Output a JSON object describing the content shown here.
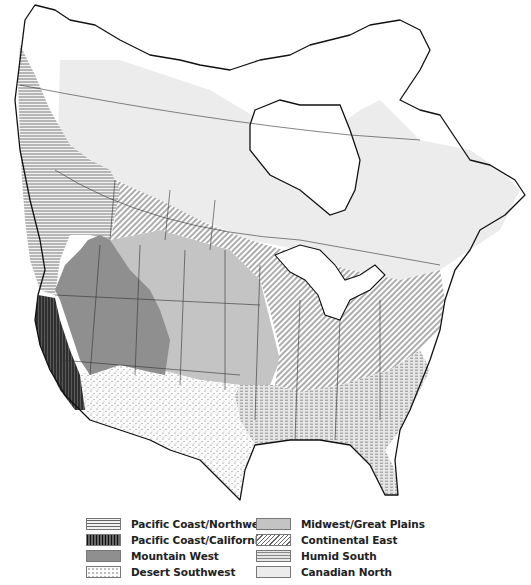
{
  "map": {
    "title": "",
    "extent": "North America (Canada, United States, northern Mexico)",
    "regions": [
      {
        "id": "pacific-northwest",
        "name": "Pacific Coast/Northwest",
        "pattern": "horizontal-lines",
        "color": "#8a8a8a"
      },
      {
        "id": "pacific-california",
        "name": "Pacific Coast/California",
        "pattern": "vertical-lines",
        "color": "#3a3a3a"
      },
      {
        "id": "mountain-west",
        "name": "Mountain West",
        "pattern": "solid",
        "color": "#8f8f8f"
      },
      {
        "id": "desert-southwest",
        "name": "Desert Southwest",
        "pattern": "dots",
        "color": "#f4f4f4"
      },
      {
        "id": "midwest-great-plains",
        "name": "Midwest/Great Plains",
        "pattern": "solid",
        "color": "#c4c4c4"
      },
      {
        "id": "continental-east",
        "name": "Continental East",
        "pattern": "diagonal-lines",
        "color": "#8c8c8c"
      },
      {
        "id": "humid-south",
        "name": "Humid South",
        "pattern": "dashed-lines",
        "color": "#d6d6d6"
      },
      {
        "id": "canadian-north",
        "name": "Canadian North",
        "pattern": "solid",
        "color": "#ececec"
      }
    ]
  },
  "legend": {
    "left": [
      {
        "label": "Pacific Coast/Northwest",
        "swatch": "pacific-northwest"
      },
      {
        "label": "Pacific Coast/California",
        "swatch": "pacific-california"
      },
      {
        "label": "Mountain West",
        "swatch": "mountain-west"
      },
      {
        "label": "Desert Southwest",
        "swatch": "desert-southwest"
      }
    ],
    "right": [
      {
        "label": "Midwest/Great Plains",
        "swatch": "midwest-great-plains"
      },
      {
        "label": "Continental East",
        "swatch": "continental-east"
      },
      {
        "label": "Humid South",
        "swatch": "humid-south"
      },
      {
        "label": "Canadian North",
        "swatch": "canadian-north"
      }
    ]
  }
}
